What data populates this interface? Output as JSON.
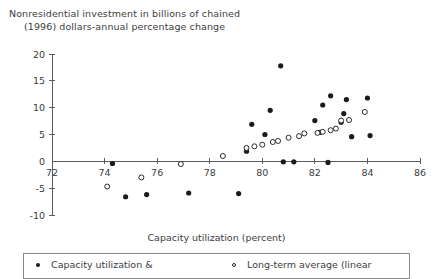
{
  "chart_data": {
    "type": "scatter",
    "title": "Nonresidential investment in billions of chained (1996) dollars-annual percentage change",
    "title_lines": [
      "Nonresidential investment in billions of chained",
      "(1996) dollars-annual percentage change"
    ],
    "xlabel": "Capacity utilization (percent)",
    "ylabel": "",
    "xlim": [
      72,
      86
    ],
    "ylim": [
      -10,
      20
    ],
    "xticks": [
      72,
      74,
      76,
      78,
      80,
      82,
      84,
      86
    ],
    "xtick_labels": [
      "72",
      "74",
      "76",
      "78",
      "80",
      "82",
      "84",
      "86"
    ],
    "yticks": [
      -10,
      -5,
      0,
      5,
      10,
      15,
      20
    ],
    "ytick_labels": [
      "-10",
      "-5",
      "0",
      "5",
      "10",
      "15",
      "20"
    ],
    "grid": false,
    "legend_position": "bottom",
    "series": [
      {
        "name": "Capacity utilization &",
        "marker": "filled-circle",
        "color": "#1b1b1b",
        "points": [
          [
            74.3,
            -0.4
          ],
          [
            74.8,
            -6.6
          ],
          [
            75.6,
            -6.2
          ],
          [
            77.2,
            -5.9
          ],
          [
            79.1,
            -6.0
          ],
          [
            79.4,
            1.9
          ],
          [
            79.6,
            6.9
          ],
          [
            80.1,
            5.0
          ],
          [
            80.3,
            9.5
          ],
          [
            80.7,
            17.8
          ],
          [
            80.8,
            -0.1
          ],
          [
            81.2,
            -0.1
          ],
          [
            82.0,
            7.6
          ],
          [
            82.2,
            5.4
          ],
          [
            82.3,
            10.5
          ],
          [
            82.5,
            -0.2
          ],
          [
            82.6,
            12.2
          ],
          [
            83.0,
            7.3
          ],
          [
            83.1,
            8.9
          ],
          [
            83.2,
            11.5
          ],
          [
            83.4,
            4.6
          ],
          [
            84.0,
            11.8
          ],
          [
            84.1,
            4.8
          ]
        ]
      },
      {
        "name": "Long-term average (linear",
        "marker": "hollow-circle",
        "color": "#2b2b2b",
        "points": [
          [
            74.1,
            -4.7
          ],
          [
            75.4,
            -3.0
          ],
          [
            76.9,
            -0.5
          ],
          [
            78.5,
            1.0
          ],
          [
            79.4,
            2.5
          ],
          [
            79.7,
            2.8
          ],
          [
            80.0,
            3.1
          ],
          [
            80.4,
            3.6
          ],
          [
            80.6,
            3.8
          ],
          [
            81.0,
            4.4
          ],
          [
            81.4,
            4.7
          ],
          [
            81.6,
            5.2
          ],
          [
            82.1,
            5.3
          ],
          [
            82.3,
            5.5
          ],
          [
            82.6,
            5.8
          ],
          [
            82.8,
            6.1
          ],
          [
            83.0,
            7.6
          ],
          [
            83.3,
            7.7
          ],
          [
            83.9,
            9.2
          ]
        ]
      }
    ]
  },
  "legend": {
    "entries": [
      {
        "label": "Capacity utilization &",
        "marker": "filled-circle"
      },
      {
        "label": "Long-term average (linear",
        "marker": "hollow-circle"
      }
    ]
  }
}
